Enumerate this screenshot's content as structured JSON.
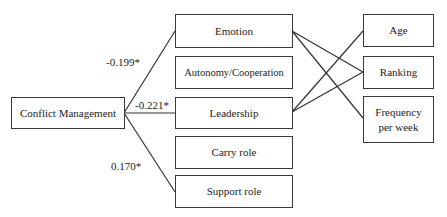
{
  "diagram": {
    "source": {
      "label": "Conflict Management"
    },
    "middle": [
      {
        "id": "emotion",
        "label": "Emotion"
      },
      {
        "id": "autonomy",
        "label": "Autonomy/Cooperation"
      },
      {
        "id": "leadership",
        "label": "Leadership"
      },
      {
        "id": "carry",
        "label": "Carry role"
      },
      {
        "id": "support",
        "label": "Support role"
      }
    ],
    "right": [
      {
        "id": "age",
        "label": "Age"
      },
      {
        "id": "ranking",
        "label": "Ranking"
      },
      {
        "id": "frequency",
        "label": "Frequency per week",
        "line1": "Frequency",
        "line2": "per week"
      }
    ],
    "edges": [
      {
        "from": "Conflict Management",
        "to": "Emotion",
        "coefficient": "-0.199*"
      },
      {
        "from": "Conflict Management",
        "to": "Leadership",
        "coefficient": "-0.221*"
      },
      {
        "from": "Conflict Management",
        "to": "Support role",
        "coefficient": "0.170*"
      },
      {
        "from": "Emotion",
        "to": "Ranking"
      },
      {
        "from": "Emotion",
        "to": "Frequency per week"
      },
      {
        "from": "Leadership",
        "to": "Age"
      },
      {
        "from": "Leadership",
        "to": "Ranking"
      }
    ]
  }
}
